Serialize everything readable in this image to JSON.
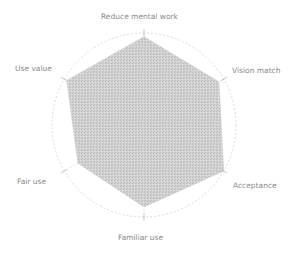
{
  "chart_data": {
    "type": "radar",
    "title": "",
    "categories": [
      "Reduce mental work",
      "Vision match",
      "Acceptance",
      "Familiar use",
      "Fair use",
      "Use value"
    ],
    "series": [
      {
        "name": "score",
        "values": [
          0.96,
          0.94,
          1.0,
          0.89,
          0.83,
          0.97
        ]
      }
    ],
    "rlim": [
      0,
      1
    ],
    "grid": "dotted outer circle and dotted spokes",
    "legend": "none",
    "fill_color": "#c8c8c8",
    "line_color": "#d6d6d6"
  },
  "labels": {
    "reduce_mental_work": "Reduce mental work",
    "vision_match": "Vision match",
    "acceptance": "Acceptance",
    "familiar_use": "Familiar use",
    "fair_use": "Fair use",
    "use_value": "Use value"
  }
}
